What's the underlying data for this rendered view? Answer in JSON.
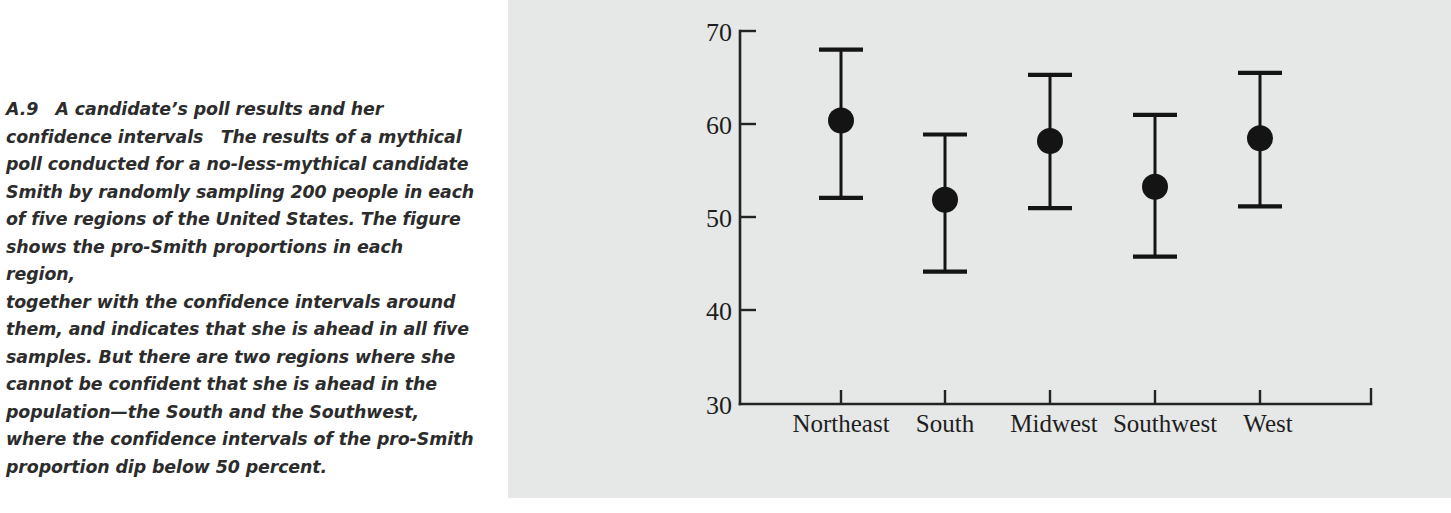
{
  "caption": {
    "label": "A.9",
    "title": "A candidate’s poll results and her confidence intervals",
    "body": "A.9 A candidate’s poll results and her\nconfidence intervals The results of a mythical\npoll conducted for a no-less-mythical candidate\nSmith by randomly sampling 200 people in each\nof five regions of the United States. The figure\nshows the pro-Smith proportions in each region,\ntogether with the confidence intervals around\nthem, and indicates that she is ahead in all five\nsamples. But there are two regions where she\ncannot be confident that she is ahead in the\npopulation—the South and the Southwest,\nwhere the confidence intervals of the pro-Smith\nproportion dip below 50 percent."
  },
  "colors": {
    "panel_background": "#e6e7e7",
    "page_background": "#ffffff",
    "ink": "#141414",
    "axis": "#232323",
    "caption_text": "#2c2c2c"
  },
  "chart_data": {
    "type": "scatter",
    "title": "",
    "subtitle": "",
    "xlabel": "",
    "ylabel": "",
    "categories": [
      "Northeast",
      "South",
      "Midwest",
      "Southwest",
      "West"
    ],
    "values": [
      60.4,
      51.9,
      58.2,
      53.3,
      58.5
    ],
    "ci_lower": [
      52.1,
      44.2,
      51.0,
      45.8,
      51.2
    ],
    "ci_upper": [
      68.0,
      58.9,
      65.3,
      61.0,
      65.5
    ],
    "series": [
      {
        "name": "pro-Smith proportion",
        "values": [
          60.4,
          51.9,
          58.2,
          53.3,
          58.5
        ],
        "ci_lower": [
          52.1,
          44.2,
          51.0,
          45.8,
          51.2
        ],
        "ci_upper": [
          68.0,
          58.9,
          65.3,
          61.0,
          65.5
        ]
      }
    ],
    "ylim": [
      30,
      70
    ],
    "yticks": [
      30,
      40,
      50,
      60,
      70
    ],
    "ytick_labels": [
      "30",
      "40",
      "50",
      "60",
      "70"
    ],
    "grid": false,
    "legend": false,
    "legend_position": "none",
    "marker": "filled-circle",
    "error_bars": "capped-vertical",
    "n_per_region": 200,
    "reference_note": "50 percent"
  }
}
